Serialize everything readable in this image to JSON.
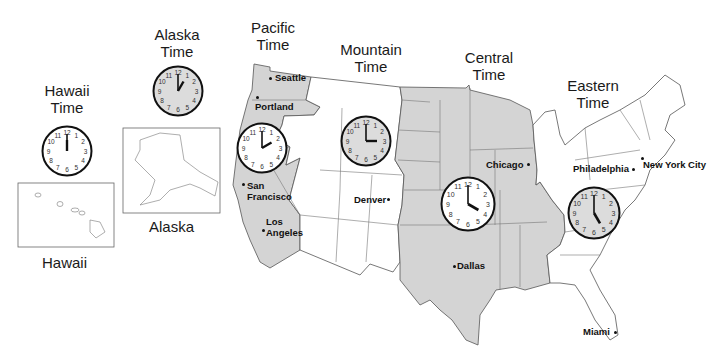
{
  "colors": {
    "shaded_zone": "#d4d4d4",
    "unshaded_zone": "#ffffff",
    "border": "#555555",
    "clock_rim": "#111111",
    "clock_face_white": "#ffffff",
    "clock_face_gray": "#dcdcdc"
  },
  "zones": [
    {
      "id": "hawaii",
      "title_line1": "Hawaii",
      "title_line2": "Time",
      "clock_time": "12:00",
      "hour": 12,
      "minute": 0,
      "face": "white"
    },
    {
      "id": "alaska",
      "title_line1": "Alaska",
      "title_line2": "Time",
      "clock_time": "1:00",
      "hour": 1,
      "minute": 0,
      "face": "gray"
    },
    {
      "id": "pacific",
      "title_line1": "Pacific",
      "title_line2": "Time",
      "clock_time": "2:00",
      "hour": 2,
      "minute": 0,
      "face": "white"
    },
    {
      "id": "mountain",
      "title_line1": "Mountain",
      "title_line2": "Time",
      "clock_time": "3:00",
      "hour": 3,
      "minute": 0,
      "face": "gray"
    },
    {
      "id": "central",
      "title_line1": "Central",
      "title_line2": "Time",
      "clock_time": "4:00",
      "hour": 4,
      "minute": 0,
      "face": "white"
    },
    {
      "id": "eastern",
      "title_line1": "Eastern",
      "title_line2": "Time",
      "clock_time": "5:00",
      "hour": 5,
      "minute": 0,
      "face": "gray"
    }
  ],
  "insets": {
    "hawaii_label": "Hawaii",
    "alaska_label": "Alaska"
  },
  "cities": [
    {
      "name": "Seattle",
      "zone": "pacific"
    },
    {
      "name": "Portland",
      "zone": "pacific"
    },
    {
      "name": "San Francisco",
      "line1": "San",
      "line2": "Francisco",
      "zone": "pacific"
    },
    {
      "name": "Los Angeles",
      "line1": "Los",
      "line2": "Angeles",
      "zone": "pacific"
    },
    {
      "name": "Denver",
      "zone": "mountain"
    },
    {
      "name": "Chicago",
      "zone": "central"
    },
    {
      "name": "Dallas",
      "zone": "central"
    },
    {
      "name": "Philadelphia",
      "zone": "eastern"
    },
    {
      "name": "New York City",
      "zone": "eastern"
    },
    {
      "name": "Miami",
      "zone": "eastern"
    }
  ],
  "clock_numerals": [
    "12",
    "1",
    "2",
    "3",
    "4",
    "5",
    "6",
    "7",
    "8",
    "9",
    "10",
    "11"
  ]
}
